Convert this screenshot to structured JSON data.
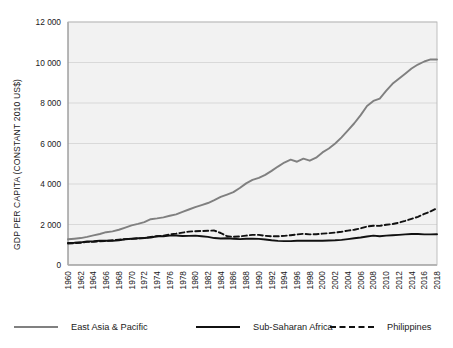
{
  "chart_data": {
    "type": "line",
    "title": "",
    "xlabel": "",
    "ylabel": "GDP PER CAPITA (CONSTANT 2010 US$)",
    "ylim": [
      0,
      12000
    ],
    "xlim": [
      1960,
      2018
    ],
    "grid": true,
    "legend_position": "bottom",
    "ytick_labels": [
      "0",
      "2 000",
      "4 000",
      "6 000",
      "8 000",
      "10 000",
      "12 000"
    ],
    "ytick_values": [
      0,
      2000,
      4000,
      6000,
      8000,
      10000,
      12000
    ],
    "xtick_labels": [
      "1960",
      "1962",
      "1964",
      "1966",
      "1968",
      "1970",
      "1972",
      "1974",
      "1976",
      "1978",
      "1980",
      "1982",
      "1984",
      "1986",
      "1988",
      "1990",
      "1992",
      "1994",
      "1996",
      "1998",
      "2000",
      "2002",
      "2004",
      "2006",
      "2008",
      "2010",
      "2012",
      "2014",
      "2016",
      "2018"
    ],
    "x": [
      1960,
      1961,
      1962,
      1963,
      1964,
      1965,
      1966,
      1967,
      1968,
      1969,
      1970,
      1971,
      1972,
      1973,
      1974,
      1975,
      1976,
      1977,
      1978,
      1979,
      1980,
      1981,
      1982,
      1983,
      1984,
      1985,
      1986,
      1987,
      1988,
      1989,
      1990,
      1991,
      1992,
      1993,
      1994,
      1995,
      1996,
      1997,
      1998,
      1999,
      2000,
      2001,
      2002,
      2003,
      2004,
      2005,
      2006,
      2007,
      2008,
      2009,
      2010,
      2011,
      2012,
      2013,
      2014,
      2015,
      2016,
      2017,
      2018
    ],
    "series": [
      {
        "name": "East Asia & Pacific",
        "color": "#808080",
        "style": "solid",
        "values": [
          1270,
          1300,
          1330,
          1390,
          1460,
          1530,
          1620,
          1660,
          1740,
          1850,
          1960,
          2030,
          2120,
          2260,
          2300,
          2350,
          2430,
          2500,
          2620,
          2740,
          2860,
          2960,
          3060,
          3200,
          3360,
          3480,
          3600,
          3800,
          4030,
          4200,
          4300,
          4450,
          4650,
          4860,
          5060,
          5200,
          5100,
          5250,
          5150,
          5300,
          5560,
          5750,
          6000,
          6300,
          6650,
          7000,
          7400,
          7850,
          8100,
          8220,
          8600,
          8950,
          9200,
          9450,
          9700,
          9900,
          10050,
          10150,
          10150
        ]
      },
      {
        "name": "Sub-Saharan Africa",
        "color": "#111111",
        "style": "solid",
        "values": [
          1090,
          1100,
          1120,
          1160,
          1170,
          1200,
          1200,
          1190,
          1220,
          1270,
          1300,
          1320,
          1330,
          1360,
          1420,
          1420,
          1450,
          1460,
          1430,
          1440,
          1450,
          1420,
          1390,
          1330,
          1310,
          1320,
          1300,
          1280,
          1300,
          1300,
          1290,
          1260,
          1220,
          1190,
          1180,
          1180,
          1200,
          1200,
          1200,
          1200,
          1200,
          1210,
          1220,
          1240,
          1280,
          1320,
          1360,
          1410,
          1450,
          1420,
          1450,
          1470,
          1490,
          1510,
          1530,
          1530,
          1510,
          1510,
          1520
        ]
      },
      {
        "name": "Philippines",
        "color": "#111111",
        "style": "dashed",
        "values": [
          1060,
          1080,
          1100,
          1140,
          1140,
          1170,
          1190,
          1220,
          1250,
          1280,
          1290,
          1310,
          1330,
          1390,
          1420,
          1450,
          1510,
          1550,
          1600,
          1650,
          1670,
          1680,
          1690,
          1700,
          1580,
          1420,
          1390,
          1410,
          1450,
          1490,
          1490,
          1440,
          1420,
          1420,
          1440,
          1470,
          1510,
          1540,
          1510,
          1520,
          1550,
          1570,
          1600,
          1640,
          1700,
          1740,
          1810,
          1900,
          1940,
          1930,
          1990,
          2020,
          2090,
          2180,
          2280,
          2380,
          2520,
          2650,
          2800
        ]
      }
    ]
  },
  "legend": {
    "items": [
      {
        "label": "East Asia & Pacific",
        "color": "#808080",
        "style": "solid"
      },
      {
        "label": "Sub-Saharan Africa",
        "color": "#111111",
        "style": "solid"
      },
      {
        "label": "Philippines",
        "color": "#111111",
        "style": "dashed"
      }
    ]
  }
}
